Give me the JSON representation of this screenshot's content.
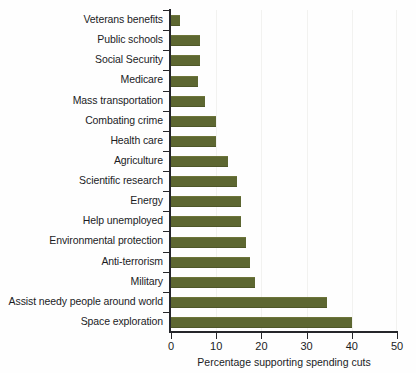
{
  "chart_data": {
    "type": "bar",
    "orientation": "horizontal",
    "title": "",
    "xlabel": "Percentage supporting spending cuts",
    "ylabel": "",
    "xlim": [
      0,
      50
    ],
    "ylim": null,
    "xticks": [
      0,
      10,
      20,
      30,
      40,
      50
    ],
    "xtick_labels": [
      "0",
      "10",
      "20",
      "30",
      "40",
      "50"
    ],
    "grid": "faint vertical gridlines at x ticks",
    "legend": "none",
    "bar_color": "#5d6731",
    "axis_color": "#25262a",
    "categories": [
      "Veterans benefits",
      "Public schools",
      "Social Security",
      "Medicare",
      "Mass transportation",
      "Combating crime",
      "Health care",
      "Agriculture",
      "Scientific research",
      "Energy",
      "Help unemployed",
      "Environmental protection",
      "Anti-terrorism",
      "Military",
      "Assist needy people around world",
      "Space exploration"
    ],
    "values": [
      2,
      6.5,
      6.5,
      6,
      7.5,
      10,
      10,
      12.5,
      14.5,
      15.5,
      15.5,
      16.5,
      17.5,
      18.5,
      34.5,
      40
    ]
  }
}
